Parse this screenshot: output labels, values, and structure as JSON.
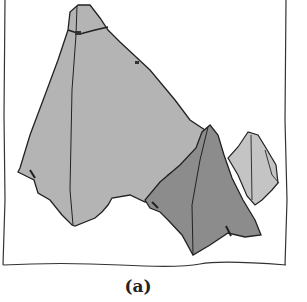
{
  "figure": {
    "caption": "(a)",
    "colors": {
      "large_piece": "#b4b4b4",
      "dark_piece": "#8c8c8c",
      "small_piece": "#c4c4c4",
      "outline": "#222222"
    }
  }
}
